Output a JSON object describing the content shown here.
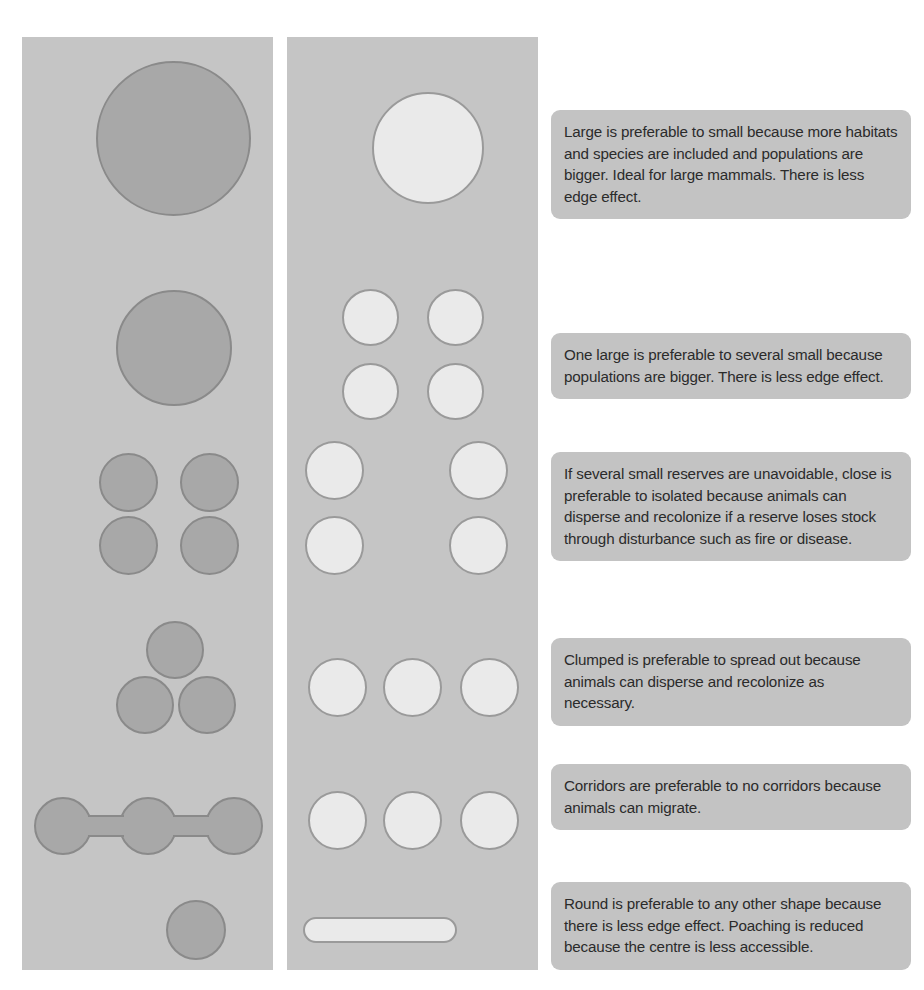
{
  "figure": {
    "panels": [
      {
        "name": "better-design-panel",
        "label": "Better design",
        "fill": "#c5c5c5"
      },
      {
        "name": "worse-design-panel",
        "label": "Worse design",
        "fill": "#c5c5c5"
      }
    ],
    "colors": {
      "panel_background": "#c5c5c5",
      "better_shape_fill": "#a8a8a8",
      "better_shape_stroke": "#8a8a8a",
      "worse_shape_fill": "#eaeaea",
      "worse_shape_stroke": "#9a9a9a",
      "callout_background": "#c3c3c3",
      "callout_text": "#2b2b2b",
      "page_background": "#ffffff"
    }
  },
  "principles": [
    {
      "id": "large-vs-small",
      "text": "Large is preferable to small because more habitats and species are included and populations are bigger. Ideal for large mammals. There is less edge effect.",
      "better_shapes": [
        {
          "type": "circle",
          "cx": 173,
          "cy": 138,
          "d": 155
        }
      ],
      "worse_shapes": [
        {
          "type": "circle",
          "cx": 428,
          "cy": 148,
          "d": 112
        }
      ]
    },
    {
      "id": "one-large-vs-several-small",
      "text": "One large is preferable to several small because populations are bigger. There is less edge effect.",
      "better_shapes": [
        {
          "type": "circle",
          "cx": 174,
          "cy": 348,
          "d": 116
        }
      ],
      "worse_shapes": [
        {
          "type": "circle",
          "cx": 370,
          "cy": 317,
          "d": 57
        },
        {
          "type": "circle",
          "cx": 455,
          "cy": 317,
          "d": 57
        },
        {
          "type": "circle",
          "cx": 370,
          "cy": 391,
          "d": 57
        },
        {
          "type": "circle",
          "cx": 455,
          "cy": 391,
          "d": 57
        }
      ]
    },
    {
      "id": "close-vs-isolated",
      "text": "If several small reserves are unavoidable, close is preferable to isolated because animals can disperse and recolonize if a reserve loses stock through disturbance such as fire or disease.",
      "better_shapes": [
        {
          "type": "circle",
          "cx": 128,
          "cy": 482,
          "d": 59
        },
        {
          "type": "circle",
          "cx": 209,
          "cy": 482,
          "d": 59
        },
        {
          "type": "circle",
          "cx": 128,
          "cy": 545,
          "d": 59
        },
        {
          "type": "circle",
          "cx": 209,
          "cy": 545,
          "d": 59
        }
      ],
      "worse_shapes": [
        {
          "type": "circle",
          "cx": 334,
          "cy": 470,
          "d": 59
        },
        {
          "type": "circle",
          "cx": 478,
          "cy": 470,
          "d": 59
        },
        {
          "type": "circle",
          "cx": 334,
          "cy": 545,
          "d": 59
        },
        {
          "type": "circle",
          "cx": 478,
          "cy": 545,
          "d": 59
        }
      ]
    },
    {
      "id": "clumped-vs-spread-out",
      "text": "Clumped is preferable to spread out because animals can disperse and recolonize as necessary.",
      "better_shapes": [
        {
          "type": "circle",
          "cx": 175,
          "cy": 650,
          "d": 58
        },
        {
          "type": "circle",
          "cx": 145,
          "cy": 705,
          "d": 58
        },
        {
          "type": "circle",
          "cx": 207,
          "cy": 705,
          "d": 58
        }
      ],
      "worse_shapes": [
        {
          "type": "circle",
          "cx": 337,
          "cy": 687,
          "d": 59
        },
        {
          "type": "circle",
          "cx": 412,
          "cy": 687,
          "d": 59
        },
        {
          "type": "circle",
          "cx": 489,
          "cy": 687,
          "d": 59
        }
      ]
    },
    {
      "id": "corridors-vs-no-corridors",
      "text": "Corridors are preferable to no corridors because animals can migrate.",
      "better_shapes": [
        {
          "type": "circle",
          "cx": 63,
          "cy": 826,
          "d": 58
        },
        {
          "type": "circle",
          "cx": 148,
          "cy": 826,
          "d": 58
        },
        {
          "type": "circle",
          "cx": 234,
          "cy": 826,
          "d": 58
        },
        {
          "type": "corridor",
          "x1": 88,
          "x2": 124,
          "cy": 826,
          "h": 22
        },
        {
          "type": "corridor",
          "x1": 173,
          "x2": 209,
          "cy": 826,
          "h": 22
        }
      ],
      "worse_shapes": [
        {
          "type": "circle",
          "cx": 337,
          "cy": 820,
          "d": 59
        },
        {
          "type": "circle",
          "cx": 412,
          "cy": 820,
          "d": 59
        },
        {
          "type": "circle",
          "cx": 489,
          "cy": 820,
          "d": 59
        }
      ]
    },
    {
      "id": "round-vs-other-shape",
      "text": "Round is preferable to any other shape because there is less edge effect. Poaching is reduced because the centre is less accessible.",
      "better_shapes": [
        {
          "type": "circle",
          "cx": 196,
          "cy": 930,
          "d": 60
        }
      ],
      "worse_shapes": [
        {
          "type": "bar",
          "cx": 380,
          "cy": 930,
          "w": 154,
          "h": 26
        }
      ]
    }
  ],
  "callouts": [
    {
      "id": "callout-large-vs-small",
      "top": 110,
      "height": 108
    },
    {
      "id": "callout-one-large-vs-several-small",
      "top": 333,
      "height": 64
    },
    {
      "id": "callout-close-vs-isolated",
      "top": 452,
      "height": 108
    },
    {
      "id": "callout-clumped-vs-spread-out",
      "top": 638,
      "height": 64
    },
    {
      "id": "callout-corridors",
      "top": 764,
      "height": 64
    },
    {
      "id": "callout-round",
      "top": 882,
      "height": 86
    }
  ]
}
